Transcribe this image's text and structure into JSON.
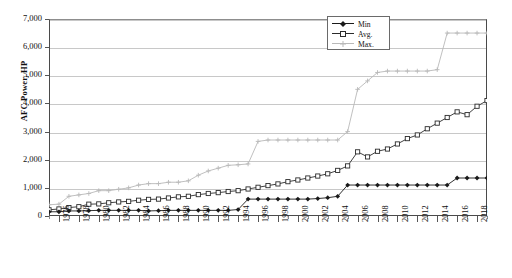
{
  "chart_data": {
    "type": "line",
    "title": "",
    "xlabel": "",
    "ylabel": "AFC Power, HP",
    "ylim": [
      0,
      7000
    ],
    "ytick_values": [
      0,
      1000,
      2000,
      3000,
      4000,
      5000,
      6000,
      7000
    ],
    "ytick_labels": [
      "0",
      "1,000",
      "2,000",
      "3,000",
      "4,000",
      "5,000",
      "6,000",
      "7,000"
    ],
    "grid": "horizontal",
    "legend_position": "top-right",
    "xlim": [
      1975,
      2019
    ],
    "x": [
      1975,
      1976,
      1977,
      1978,
      1979,
      1980,
      1981,
      1982,
      1983,
      1984,
      1985,
      1986,
      1987,
      1988,
      1989,
      1990,
      1991,
      1992,
      1993,
      1994,
      1995,
      1996,
      1997,
      1998,
      1999,
      2000,
      2001,
      2002,
      2003,
      2004,
      2005,
      2006,
      2007,
      2008,
      2009,
      2010,
      2011,
      2012,
      2013,
      2014,
      2015,
      2016,
      2017,
      2018,
      2019
    ],
    "xtick_labels": [
      "1976",
      "1978",
      "1980",
      "1982",
      "1984",
      "1986",
      "1988",
      "1990",
      "1992",
      "1994",
      "1996",
      "1998",
      "2000",
      "2002",
      "2004",
      "2006",
      "2008",
      "2010",
      "2012",
      "2014",
      "2016",
      "2018"
    ],
    "xtick_values": [
      1976,
      1978,
      1980,
      1982,
      1984,
      1986,
      1988,
      1990,
      1992,
      1994,
      1996,
      1998,
      2000,
      2002,
      2004,
      2006,
      2008,
      2010,
      2012,
      2014,
      2016,
      2018
    ],
    "series": [
      {
        "name": "Min",
        "marker": "filled-diamond",
        "color": "#1a1a1a",
        "values": [
          150,
          150,
          180,
          180,
          190,
          200,
          200,
          200,
          200,
          200,
          180,
          190,
          200,
          200,
          200,
          200,
          200,
          200,
          200,
          230,
          600,
          600,
          600,
          600,
          600,
          600,
          600,
          620,
          650,
          700,
          1100,
          1100,
          1100,
          1100,
          1100,
          1100,
          1100,
          1100,
          1100,
          1100,
          1100,
          1350,
          1350,
          1350,
          1350
        ]
      },
      {
        "name": "Avg.",
        "marker": "open-square",
        "color": "#2b2b2b",
        "values": [
          220,
          250,
          300,
          330,
          420,
          430,
          470,
          500,
          520,
          560,
          590,
          600,
          640,
          680,
          700,
          760,
          800,
          830,
          870,
          900,
          960,
          1020,
          1080,
          1140,
          1220,
          1280,
          1350,
          1420,
          1500,
          1620,
          1780,
          2280,
          2100,
          2300,
          2380,
          2560,
          2750,
          2880,
          3100,
          3300,
          3500,
          3700,
          3600,
          3900,
          4100
        ]
      },
      {
        "name": "Max.",
        "marker": "open-cross",
        "color": "#b9b9b9",
        "values": [
          400,
          420,
          700,
          750,
          800,
          900,
          900,
          950,
          1000,
          1100,
          1150,
          1150,
          1200,
          1200,
          1250,
          1450,
          1600,
          1700,
          1800,
          1820,
          1850,
          2650,
          2700,
          2700,
          2700,
          2700,
          2700,
          2700,
          2700,
          2700,
          3000,
          4500,
          4800,
          5100,
          5150,
          5150,
          5150,
          5150,
          5150,
          5200,
          6500,
          6500,
          6500,
          6500,
          6500
        ]
      }
    ]
  },
  "legend": {
    "items": [
      {
        "label": "Min"
      },
      {
        "label": "Avg."
      },
      {
        "label": "Max."
      }
    ]
  }
}
